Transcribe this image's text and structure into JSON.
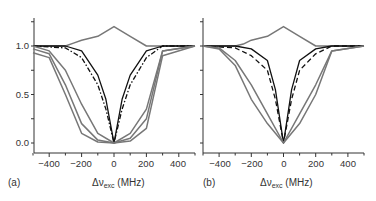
{
  "chart_data": [
    {
      "type": "line",
      "panel": "(a)",
      "xlabel": "Δν_exc (MHz)",
      "ylabel": "",
      "xlim": [
        -500,
        500
      ],
      "ylim": [
        -0.1,
        1.25
      ],
      "xticks": [
        -400,
        -200,
        0,
        200,
        400
      ],
      "yticks": [
        0.0,
        0.5,
        1.0
      ],
      "grid": false,
      "series": [
        {
          "name": "gray-peak",
          "style": "solid-gray",
          "x": [
            -500,
            -300,
            -250,
            -200,
            -100,
            0,
            100,
            200,
            250,
            300,
            500
          ],
          "y": [
            1.0,
            1.0,
            1.03,
            1.06,
            1.1,
            1.2,
            1.1,
            1.0,
            1.0,
            1.0,
            1.0
          ]
        },
        {
          "name": "black-narrow",
          "style": "solid-black",
          "x": [
            -500,
            -300,
            -200,
            -100,
            -50,
            0,
            50,
            100,
            200,
            300,
            500
          ],
          "y": [
            1.0,
            1.0,
            0.95,
            0.7,
            0.45,
            0.0,
            0.45,
            0.7,
            0.95,
            1.0,
            1.0
          ]
        },
        {
          "name": "black-dashdot",
          "style": "dashdot-black",
          "x": [
            -500,
            -300,
            -200,
            -100,
            -50,
            0,
            50,
            100,
            200,
            300,
            500
          ],
          "y": [
            1.0,
            0.98,
            0.88,
            0.6,
            0.35,
            0.0,
            0.35,
            0.6,
            0.88,
            1.0,
            1.0
          ]
        },
        {
          "name": "gray-broad-1",
          "style": "solid-gray",
          "x": [
            -500,
            -400,
            -300,
            -200,
            -100,
            0,
            100,
            200,
            300,
            500
          ],
          "y": [
            1.0,
            0.95,
            0.75,
            0.4,
            0.1,
            0.0,
            0.1,
            0.35,
            0.95,
            1.0
          ]
        },
        {
          "name": "gray-broad-2",
          "style": "solid-gray",
          "x": [
            -500,
            -400,
            -300,
            -200,
            -100,
            0,
            100,
            200,
            300,
            500
          ],
          "y": [
            0.97,
            0.92,
            0.6,
            0.2,
            0.03,
            0.0,
            0.05,
            0.25,
            0.95,
            1.0
          ]
        },
        {
          "name": "gray-broad-3",
          "style": "solid-gray",
          "x": [
            -500,
            -400,
            -300,
            -200,
            -100,
            0,
            100,
            200,
            300,
            500
          ],
          "y": [
            0.93,
            0.88,
            0.5,
            0.1,
            0.01,
            0.0,
            0.02,
            0.15,
            0.9,
            1.0
          ]
        }
      ]
    },
    {
      "type": "line",
      "panel": "(b)",
      "xlabel": "Δν_exc (MHz)",
      "ylabel": "",
      "xlim": [
        -500,
        500
      ],
      "ylim": [
        -0.1,
        1.25
      ],
      "xticks": [
        -400,
        -200,
        0,
        200,
        400
      ],
      "yticks": [
        0.0,
        0.5,
        1.0
      ],
      "grid": false,
      "series": [
        {
          "name": "gray-peak",
          "style": "solid-gray",
          "x": [
            -500,
            -300,
            -250,
            -200,
            -100,
            0,
            100,
            200,
            250,
            500
          ],
          "y": [
            1.0,
            1.0,
            1.02,
            1.06,
            1.1,
            1.2,
            1.1,
            1.0,
            1.0,
            1.0
          ]
        },
        {
          "name": "black-narrow",
          "style": "solid-black",
          "x": [
            -500,
            -300,
            -200,
            -100,
            -50,
            0,
            50,
            100,
            200,
            300,
            500
          ],
          "y": [
            1.0,
            1.0,
            0.97,
            0.85,
            0.55,
            0.0,
            0.55,
            0.85,
            0.97,
            1.0,
            1.0
          ]
        },
        {
          "name": "black-dashed",
          "style": "dashed-black",
          "x": [
            -500,
            -300,
            -200,
            -100,
            -50,
            0,
            50,
            100,
            200,
            300,
            500
          ],
          "y": [
            1.0,
            0.98,
            0.9,
            0.75,
            0.45,
            0.0,
            0.45,
            0.75,
            0.92,
            1.0,
            1.0
          ]
        },
        {
          "name": "gray-broad-1",
          "style": "solid-gray",
          "x": [
            -500,
            -400,
            -300,
            -200,
            -100,
            0,
            100,
            200,
            300,
            500
          ],
          "y": [
            1.0,
            0.98,
            0.85,
            0.6,
            0.3,
            0.0,
            0.3,
            0.6,
            0.95,
            1.0
          ]
        },
        {
          "name": "gray-broad-2",
          "style": "solid-gray",
          "x": [
            -500,
            -400,
            -300,
            -200,
            -100,
            0,
            100,
            200,
            300,
            500
          ],
          "y": [
            1.0,
            0.97,
            0.8,
            0.45,
            0.2,
            0.0,
            0.2,
            0.5,
            0.95,
            1.0
          ]
        }
      ]
    }
  ],
  "panels": {
    "a": {
      "label": "(a)",
      "xlabel_main": "Δν",
      "xlabel_sub": "exc",
      "xlabel_unit": " (MHz)",
      "xtick_labels": [
        "−400",
        "−200",
        "0",
        "200",
        "400"
      ],
      "ytick_labels": [
        "0.0",
        "0.5",
        "1.0"
      ]
    },
    "b": {
      "label": "(b)",
      "xlabel_main": "Δν",
      "xlabel_sub": "exc",
      "xlabel_unit": " (MHz)",
      "xtick_labels": [
        "−400",
        "−200",
        "0",
        "200",
        "400"
      ]
    }
  },
  "colors": {
    "black": "#111111",
    "gray": "#777777",
    "axis": "#333333"
  }
}
